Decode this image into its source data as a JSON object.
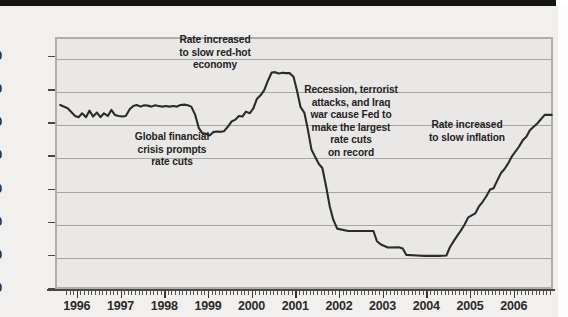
{
  "figure": {
    "background_color": "#f1f0ee",
    "plot_background_color": "#e9e8e6",
    "frame_color": "#b0aeaa",
    "gridline_color": "#a9a7a3",
    "series_color": "#2b2b2b",
    "top_bar_color": "#15140f"
  },
  "chart_data": {
    "type": "line",
    "title": "",
    "xlabel": "",
    "ylabel": "Percent",
    "ylim": [
      0,
      7.6
    ],
    "xlim": [
      1995.5,
      2006.9
    ],
    "yticks": [
      "0",
      "1.0",
      "2.0",
      "3.0",
      "4.0",
      "5.0",
      "6.0",
      "7.0"
    ],
    "ytick_values": [
      0,
      1.0,
      2.0,
      3.0,
      4.0,
      5.0,
      6.0,
      7.0
    ],
    "xticks": [
      "1996",
      "1997",
      "1998",
      "1999",
      "2000",
      "2001",
      "2002",
      "2003",
      "2004",
      "2005",
      "2006"
    ],
    "xtick_values": [
      1996,
      1997,
      1998,
      1999,
      2000,
      2001,
      2002,
      2003,
      2004,
      2005,
      2006
    ],
    "grid": "horizontal",
    "legend": "none",
    "minor_ticks": "monthly",
    "series": [
      {
        "name": "Federal funds rate",
        "x": [
          1995.62,
          1995.79,
          1995.96,
          1996.04,
          1996.12,
          1996.21,
          1996.29,
          1996.37,
          1996.46,
          1996.54,
          1996.62,
          1996.71,
          1996.79,
          1996.87,
          1996.96,
          1997.04,
          1997.12,
          1997.21,
          1997.29,
          1997.37,
          1997.46,
          1997.54,
          1997.62,
          1997.71,
          1997.79,
          1997.87,
          1997.96,
          1998.04,
          1998.12,
          1998.21,
          1998.29,
          1998.37,
          1998.46,
          1998.54,
          1998.62,
          1998.71,
          1998.79,
          1998.87,
          1998.96,
          1999.04,
          1999.12,
          1999.21,
          1999.29,
          1999.37,
          1999.46,
          1999.54,
          1999.62,
          1999.71,
          1999.79,
          1999.87,
          1999.96,
          2000.04,
          2000.12,
          2000.21,
          2000.29,
          2000.37,
          2000.46,
          2000.54,
          2000.62,
          2000.71,
          2000.79,
          2000.87,
          2000.96,
          2001.04,
          2001.12,
          2001.21,
          2001.29,
          2001.37,
          2001.46,
          2001.54,
          2001.62,
          2001.71,
          2001.79,
          2001.87,
          2001.96,
          2002.21,
          2002.54,
          2002.79,
          2002.87,
          2002.96,
          2003.12,
          2003.37,
          2003.46,
          2003.54,
          2003.79,
          2003.96,
          2004.29,
          2004.46,
          2004.54,
          2004.62,
          2004.71,
          2004.79,
          2004.87,
          2004.96,
          2005.12,
          2005.21,
          2005.29,
          2005.37,
          2005.46,
          2005.54,
          2005.62,
          2005.71,
          2005.79,
          2005.87,
          2005.96,
          2006.12,
          2006.21,
          2006.29,
          2006.37,
          2006.54,
          2006.71,
          2006.87
        ],
        "y": [
          5.55,
          5.45,
          5.22,
          5.18,
          5.3,
          5.18,
          5.38,
          5.2,
          5.32,
          5.18,
          5.3,
          5.22,
          5.4,
          5.25,
          5.22,
          5.2,
          5.22,
          5.42,
          5.52,
          5.55,
          5.5,
          5.54,
          5.53,
          5.5,
          5.54,
          5.52,
          5.5,
          5.52,
          5.5,
          5.52,
          5.5,
          5.55,
          5.56,
          5.54,
          5.5,
          5.25,
          4.86,
          4.7,
          4.68,
          4.63,
          4.73,
          4.75,
          4.74,
          4.76,
          4.9,
          5.05,
          5.1,
          5.22,
          5.2,
          5.35,
          5.3,
          5.45,
          5.73,
          5.85,
          6.0,
          6.27,
          6.53,
          6.54,
          6.5,
          6.52,
          6.51,
          6.51,
          6.4,
          5.98,
          5.49,
          5.31,
          4.8,
          4.21,
          3.97,
          3.77,
          3.65,
          3.07,
          2.49,
          2.09,
          1.82,
          1.75,
          1.75,
          1.75,
          1.44,
          1.34,
          1.25,
          1.26,
          1.22,
          1.03,
          1.01,
          1.0,
          1.0,
          1.01,
          1.26,
          1.43,
          1.61,
          1.76,
          1.93,
          2.16,
          2.28,
          2.5,
          2.63,
          2.79,
          3.0,
          3.04,
          3.26,
          3.5,
          3.62,
          3.78,
          4.0,
          4.29,
          4.49,
          4.59,
          4.79,
          4.99,
          5.25,
          5.25
        ]
      }
    ],
    "annotations": [
      {
        "id": "annotation-rate-increased-red-hot",
        "text": "Rate increased\nto slow red-hot\neconomy",
        "lines": [
          "Rate increased",
          "to slow red-hot",
          "economy"
        ]
      },
      {
        "id": "annotation-global-financial-crisis",
        "text": "Global financial\ncrisis prompts\nrate cuts",
        "lines": [
          "Global financial",
          "crisis prompts",
          "rate cuts"
        ]
      },
      {
        "id": "annotation-recession-terrorist-attacks",
        "text": "Recession, terrorist\nattacks, and Iraq\nwar cause Fed to\nmake the largest\nrate cuts\non record",
        "lines": [
          "Recession, terrorist",
          "attacks, and Iraq",
          "war cause Fed to",
          "make the largest",
          "rate cuts",
          "on record"
        ]
      },
      {
        "id": "annotation-rate-increased-inflation",
        "text": "Rate increased\nto slow inflation",
        "lines": [
          "Rate increased",
          "to slow inflation"
        ]
      }
    ]
  }
}
